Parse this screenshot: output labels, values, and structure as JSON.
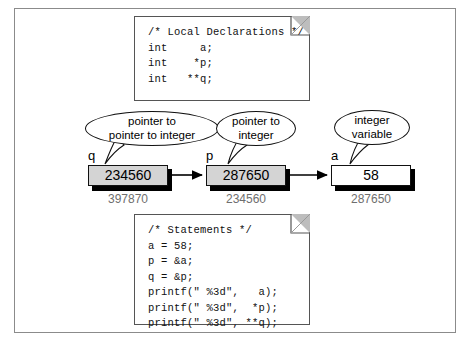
{
  "diagram": {
    "declarations_note": {
      "name": "local-declarations-note",
      "lines": [
        "/* Local Declarations */",
        "int     a;",
        "int    *p;",
        "int   **q;"
      ],
      "text": "/* Local Declarations */\nint     a;\nint    *p;\nint   **q;"
    },
    "statements_note": {
      "name": "statements-note",
      "lines": [
        "/* Statements */",
        "a = 58;",
        "p = &a;",
        "q = &p;",
        "printf(\" %3d\",   a);",
        "printf(\" %3d\",  *p);",
        "printf(\" %3d\", **q);"
      ],
      "text": "/* Statements */\na = 58;\np = &a;\nq = &p;\nprintf(\" %3d\",   a);\nprintf(\" %3d\",  *p);\nprintf(\" %3d\", **q);"
    },
    "variables": [
      {
        "name": "q",
        "value": "234560",
        "address": "397870",
        "callout": "pointer to\npointer to integer",
        "callout_line1": "pointer to",
        "callout_line2": "pointer to integer",
        "filled": true
      },
      {
        "name": "p",
        "value": "287650",
        "address": "234560",
        "callout": "pointer to\ninteger",
        "callout_line1": "pointer to",
        "callout_line2": "integer",
        "filled": true
      },
      {
        "name": "a",
        "value": "58",
        "address": "287650",
        "callout": "integer\nvariable",
        "callout_line1": "integer",
        "callout_line2": "variable",
        "filled": false
      }
    ],
    "colors": {
      "frame": "#8b8b8b",
      "box_border": "#111111",
      "box_fill": "#d4d4d4",
      "box_empty_fill": "#ffffff",
      "shadow": "#000000",
      "address_text": "#6e6e6e",
      "fold": "#bdbdbd",
      "background": "#ffffff"
    }
  }
}
